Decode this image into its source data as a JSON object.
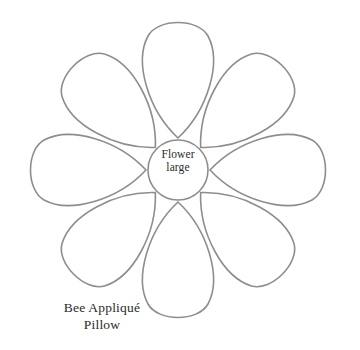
{
  "canvas": {
    "width": 360,
    "height": 350,
    "background_color": "#ffffff"
  },
  "template": {
    "title": "Flower large",
    "center_label_lines": [
      "Flower",
      "large"
    ],
    "caption_lines": [
      "Bee Appliqué",
      "Pillow"
    ],
    "outline_color": "#8d8d8d",
    "fill_color": "#ffffff",
    "text_color": "#2b2b2b"
  },
  "flower": {
    "center_x": 178,
    "center_y": 170,
    "center_radius": 30,
    "petal_count": 8,
    "petal_length": 152,
    "petal_angles_deg": [
      0,
      45,
      90,
      135,
      180,
      225,
      270,
      315
    ],
    "petal_names": [
      "petal-right",
      "petal-bottom-right",
      "petal-bottom",
      "petal-bottom-left",
      "petal-left",
      "petal-top-left",
      "petal-top",
      "petal-top-right"
    ]
  }
}
